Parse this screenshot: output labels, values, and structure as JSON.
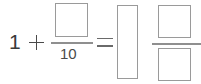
{
  "expression": {
    "full_text": "1 + □/10 = □ □/□",
    "left_side": {
      "whole_number": "1",
      "operator": "+",
      "fraction": {
        "numerator": "",
        "numerator_is_blank": true,
        "denominator": "10"
      }
    },
    "relation": "=",
    "right_side": {
      "whole_number": "",
      "whole_number_is_blank": true,
      "fraction": {
        "numerator": "",
        "numerator_is_blank": true,
        "denominator": "",
        "denominator_is_blank": true
      }
    }
  },
  "style": {
    "background": "#ffffff",
    "text_color": "#3a3a3a",
    "box_border_color": "#9a9a9a",
    "rule_color": "#8f8f8f"
  }
}
